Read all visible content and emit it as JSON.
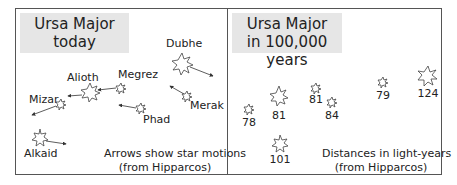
{
  "left_panel": {
    "title_line1": "Ursa Major",
    "title_line2": "today",
    "stars": [
      {
        "name": "Dubhe"
      },
      {
        "name": "Merak"
      },
      {
        "name": "Phad"
      },
      {
        "name": "Megrez"
      },
      {
        "name": "Alioth"
      },
      {
        "name": "Mizar"
      },
      {
        "name": "Alkaid"
      }
    ],
    "caption_line1": "Arrows show star motions",
    "caption_line2": "(from Hipparcos)"
  },
  "right_panel": {
    "title_line1": "Ursa Major",
    "title_line2": "in 100,000 years",
    "distances": [
      {
        "value": "78"
      },
      {
        "value": "81"
      },
      {
        "value": "81"
      },
      {
        "value": "84"
      },
      {
        "value": "79"
      },
      {
        "value": "124"
      },
      {
        "value": "101"
      }
    ],
    "caption_line1": "Distances in light-years",
    "caption_line2": "(from Hipparcos)"
  }
}
